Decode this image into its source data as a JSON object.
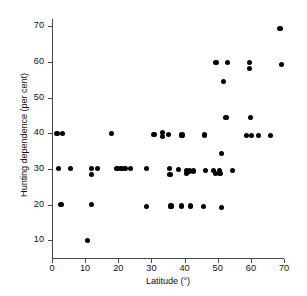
{
  "chart_data": {
    "type": "scatter",
    "title": "",
    "xlabel": "Latitude (°)",
    "ylabel": "Hunting dependence (per cent)",
    "xlim": [
      0,
      70
    ],
    "ylim": [
      5,
      72
    ],
    "xticks": [
      0,
      10,
      20,
      30,
      40,
      50,
      60,
      70
    ],
    "yticks": [
      10,
      20,
      30,
      40,
      50,
      60,
      70
    ],
    "grid": false,
    "legend": null,
    "marker": "filled-circle",
    "marker_color": "#000000",
    "points": [
      {
        "x": 1.5,
        "y": 40
      },
      {
        "x": 3.2,
        "y": 40
      },
      {
        "x": 2.0,
        "y": 30
      },
      {
        "x": 5.5,
        "y": 30
      },
      {
        "x": 2.7,
        "y": 20
      },
      {
        "x": 10.8,
        "y": 10
      },
      {
        "x": 11.8,
        "y": 20
      },
      {
        "x": 11.8,
        "y": 30
      },
      {
        "x": 11.9,
        "y": 28.5
      },
      {
        "x": 13.8,
        "y": 30
      },
      {
        "x": 18.0,
        "y": 40
      },
      {
        "x": 19.6,
        "y": 30
      },
      {
        "x": 20.8,
        "y": 30
      },
      {
        "x": 22.0,
        "y": 30
      },
      {
        "x": 23.8,
        "y": 30
      },
      {
        "x": 28.4,
        "y": 30
      },
      {
        "x": 28.6,
        "y": 19.5
      },
      {
        "x": 30.8,
        "y": 39.7
      },
      {
        "x": 33.3,
        "y": 40.2
      },
      {
        "x": 33.4,
        "y": 39.0
      },
      {
        "x": 35.1,
        "y": 39.7
      },
      {
        "x": 35.5,
        "y": 30
      },
      {
        "x": 35.6,
        "y": 28.5
      },
      {
        "x": 35.9,
        "y": 19.6
      },
      {
        "x": 38.2,
        "y": 29.8
      },
      {
        "x": 39.2,
        "y": 39.5
      },
      {
        "x": 39.1,
        "y": 19.6
      },
      {
        "x": 40.5,
        "y": 29.5
      },
      {
        "x": 40.6,
        "y": 28.6
      },
      {
        "x": 41.6,
        "y": 29.4
      },
      {
        "x": 41.8,
        "y": 19.6
      },
      {
        "x": 42.6,
        "y": 29.4
      },
      {
        "x": 45.9,
        "y": 39.5
      },
      {
        "x": 45.6,
        "y": 19.4
      },
      {
        "x": 46.2,
        "y": 29.5
      },
      {
        "x": 48.8,
        "y": 29.6
      },
      {
        "x": 49.3,
        "y": 28.7
      },
      {
        "x": 49.5,
        "y": 59.7
      },
      {
        "x": 50.6,
        "y": 29.5
      },
      {
        "x": 50.7,
        "y": 28.6
      },
      {
        "x": 51.1,
        "y": 34.3
      },
      {
        "x": 51.2,
        "y": 19.1
      },
      {
        "x": 51.8,
        "y": 54.5
      },
      {
        "x": 52.5,
        "y": 44.4
      },
      {
        "x": 53.0,
        "y": 59.7
      },
      {
        "x": 54.5,
        "y": 29.5
      },
      {
        "x": 58.8,
        "y": 39.4
      },
      {
        "x": 59.6,
        "y": 59.8
      },
      {
        "x": 59.7,
        "y": 58.2
      },
      {
        "x": 59.9,
        "y": 44.4
      },
      {
        "x": 60.1,
        "y": 39.4
      },
      {
        "x": 62.2,
        "y": 39.4
      },
      {
        "x": 65.9,
        "y": 39.4
      },
      {
        "x": 68.8,
        "y": 69.4
      },
      {
        "x": 69.3,
        "y": 59.3
      }
    ]
  }
}
